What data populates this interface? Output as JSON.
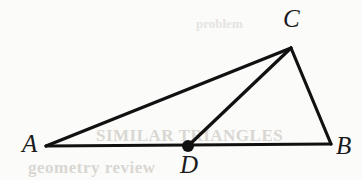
{
  "figure": {
    "name": "triangle-with-cevian",
    "background_color": "#fbfbfa",
    "stroke_color": "#111111",
    "stroke_width": 3,
    "width": 362,
    "height": 180
  },
  "points": {
    "A": {
      "label": "A",
      "x": 46,
      "y": 146,
      "label_x": 22,
      "label_y": 131
    },
    "B": {
      "label": "B",
      "x": 331,
      "y": 144,
      "label_x": 336,
      "label_y": 133
    },
    "C": {
      "label": "C",
      "x": 291,
      "y": 48,
      "label_x": 283,
      "label_y": 6
    },
    "D": {
      "label": "D",
      "x": 188,
      "y": 146,
      "label_x": 180,
      "label_y": 152
    }
  },
  "marker": {
    "name": "point-d-dot",
    "cx": 188,
    "cy": 146,
    "r": 6,
    "fill": "#111111"
  },
  "segments": [
    {
      "name": "segment-AC",
      "from": "A",
      "to": "C",
      "x1": 46,
      "y1": 146,
      "x2": 291,
      "y2": 48
    },
    {
      "name": "segment-AB",
      "from": "A",
      "to": "B",
      "x1": 46,
      "y1": 146,
      "x2": 331,
      "y2": 144
    },
    {
      "name": "segment-CB",
      "from": "C",
      "to": "B",
      "x1": 291,
      "y1": 48,
      "x2": 331,
      "y2": 144
    },
    {
      "name": "segment-CD",
      "from": "C",
      "to": "D",
      "x1": 291,
      "y1": 48,
      "x2": 188,
      "y2": 146
    }
  ],
  "ghost_text": {
    "line_a": "SIMILAR TRIANGLES",
    "line_b": "geometry review",
    "line_c": "problem"
  }
}
